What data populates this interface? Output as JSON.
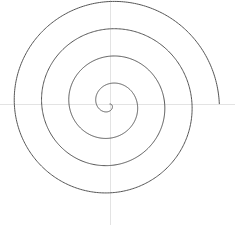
{
  "figure": {
    "title": "",
    "background_color": "#ffffff",
    "width": 235,
    "height": 225
  },
  "axes": {
    "origin_x": 110,
    "origin_y": 104,
    "axis_color": "#e3e3e3",
    "axis_width": 1,
    "x_axis_label": "",
    "y_axis_label": "",
    "x_axis_visible": true,
    "y_axis_visible": true,
    "x_axis_from": 0,
    "x_axis_to": 235,
    "y_axis_from": 0,
    "y_axis_to": 225,
    "grid": false,
    "tick_labels": []
  },
  "chart_data": {
    "type": "line",
    "title": "",
    "subtitle": "",
    "xlabel": "",
    "ylabel": "",
    "curve_name": "archimedean-spiral",
    "equation": "r = a * theta",
    "a_pixels_per_radian": 4.35,
    "theta_start_rad": 0.0,
    "theta_end_rad": 25.13,
    "turns": 4,
    "direction": "clockwise-on-screen",
    "start_angle_deg": 0,
    "stroke_color": "#555555",
    "stroke_width": 1,
    "center_px": [
      110,
      104
    ],
    "xlim": [
      0,
      235
    ],
    "ylim": [
      0,
      225
    ],
    "legend": [],
    "annotations": [],
    "radius_crossings_px": {
      "right_of_center": [
        8,
        35,
        72,
        109
      ],
      "left_of_center": [
        15,
        47,
        86
      ],
      "above_center": [
        12,
        46,
        85
      ],
      "below_center": [
        18,
        64,
        103
      ]
    },
    "extents_px": {
      "left": 24,
      "right": 219,
      "top": 19,
      "bottom": 207
    },
    "endpoint_px": [
      219,
      103
    ]
  }
}
